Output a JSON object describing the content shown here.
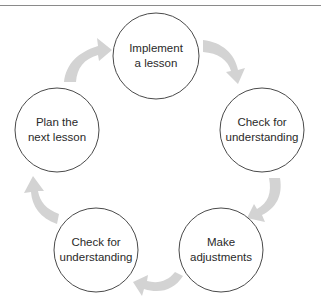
{
  "diagram": {
    "type": "cycle",
    "colors": {
      "circle_stroke": "#4a4a4a",
      "arrow_fill": "#d3d3d3",
      "text": "#2a2a2a",
      "rule": "#8a8a8a"
    },
    "nodes": [
      {
        "id": "implement",
        "lines": [
          "Implement",
          "a lesson"
        ],
        "cx": 156,
        "cy": 56,
        "r": 43
      },
      {
        "id": "check-right",
        "lines": [
          "Check for",
          "understanding"
        ],
        "cx": 262,
        "cy": 130,
        "r": 42
      },
      {
        "id": "adjust",
        "lines": [
          "Make",
          "adjustments"
        ],
        "cx": 221,
        "cy": 250,
        "r": 42
      },
      {
        "id": "check-left",
        "lines": [
          "Check for",
          "understanding"
        ],
        "cx": 96,
        "cy": 250,
        "r": 42
      },
      {
        "id": "plan",
        "lines": [
          "Plan the",
          "next lesson"
        ],
        "cx": 57,
        "cy": 130,
        "r": 42
      }
    ],
    "edges": [
      {
        "from": "plan",
        "to": "implement"
      },
      {
        "from": "implement",
        "to": "check-right"
      },
      {
        "from": "check-right",
        "to": "adjust"
      },
      {
        "from": "adjust",
        "to": "check-left"
      },
      {
        "from": "check-left",
        "to": "plan"
      }
    ]
  }
}
